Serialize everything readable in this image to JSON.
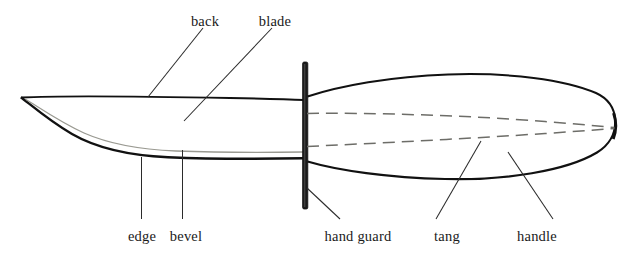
{
  "figure": {
    "background_color": "#ffffff",
    "ink_color": "#111111",
    "bevel_color": "#9a9a92",
    "tang_color": "#6d6d68",
    "labels": [
      {
        "id": "back",
        "text": "back",
        "x": 205,
        "y": 14,
        "align": "center"
      },
      {
        "id": "blade",
        "text": "blade",
        "x": 275,
        "y": 14,
        "align": "center"
      },
      {
        "id": "edge",
        "text": "edge",
        "x": 142,
        "y": 229,
        "align": "center"
      },
      {
        "id": "bevel",
        "text": "bevel",
        "x": 186,
        "y": 229,
        "align": "center"
      },
      {
        "id": "hand-guard",
        "text": "hand guard",
        "x": 358,
        "y": 229,
        "align": "center"
      },
      {
        "id": "tang",
        "text": "tang",
        "x": 447,
        "y": 229,
        "align": "center"
      },
      {
        "id": "handle",
        "text": "handle",
        "x": 537,
        "y": 229,
        "align": "center"
      }
    ],
    "parts": [
      {
        "id": "back",
        "name": "back",
        "description": "spine of the blade"
      },
      {
        "id": "blade",
        "name": "blade",
        "description": "cutting body of the knife"
      },
      {
        "id": "edge",
        "name": "edge",
        "description": "sharpened cutting edge"
      },
      {
        "id": "bevel",
        "name": "bevel",
        "description": "ground face above the edge"
      },
      {
        "id": "hand-guard",
        "name": "hand guard",
        "description": "vertical bar between blade and handle"
      },
      {
        "id": "tang",
        "name": "tang",
        "description": "blade steel extending into handle, drawn dashed"
      },
      {
        "id": "handle",
        "name": "handle",
        "description": "grip of the knife"
      }
    ]
  }
}
